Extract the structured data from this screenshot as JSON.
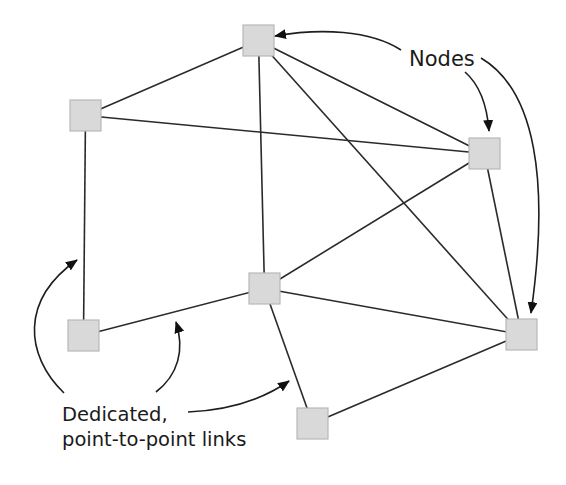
{
  "diagram": {
    "colors": {
      "background": "#ffffff",
      "node_fill": "#d9d9d9",
      "node_border": "#b8b8b8",
      "link": "#2a2a2a",
      "text": "#1a1a1a"
    },
    "node_size": 31,
    "nodes": [
      {
        "id": "top",
        "x": 243,
        "y": 25
      },
      {
        "id": "upper-left",
        "x": 70,
        "y": 100
      },
      {
        "id": "right",
        "x": 469,
        "y": 138
      },
      {
        "id": "center",
        "x": 249,
        "y": 273
      },
      {
        "id": "lower-left",
        "x": 68,
        "y": 320
      },
      {
        "id": "lower-right",
        "x": 506,
        "y": 319
      },
      {
        "id": "bottom",
        "x": 297,
        "y": 408
      }
    ],
    "links": [
      {
        "from": "top",
        "to": "upper-left"
      },
      {
        "from": "top",
        "to": "right"
      },
      {
        "from": "top",
        "to": "center"
      },
      {
        "from": "top",
        "to": "lower-right"
      },
      {
        "from": "upper-left",
        "to": "right"
      },
      {
        "from": "upper-left",
        "to": "lower-left"
      },
      {
        "from": "right",
        "to": "center"
      },
      {
        "from": "right",
        "to": "lower-right"
      },
      {
        "from": "center",
        "to": "lower-left"
      },
      {
        "from": "center",
        "to": "lower-right"
      },
      {
        "from": "center",
        "to": "bottom"
      },
      {
        "from": "bottom",
        "to": "lower-right"
      }
    ],
    "labels": {
      "nodes": "Nodes",
      "links_line1": "Dedicated,",
      "links_line2": "point-to-point links"
    },
    "callouts": {
      "nodes_arrows": [
        "top",
        "right",
        "lower-right"
      ],
      "links_arrows": [
        "upper-left—lower-left link",
        "lower-left—center link",
        "center—bottom link"
      ]
    }
  }
}
